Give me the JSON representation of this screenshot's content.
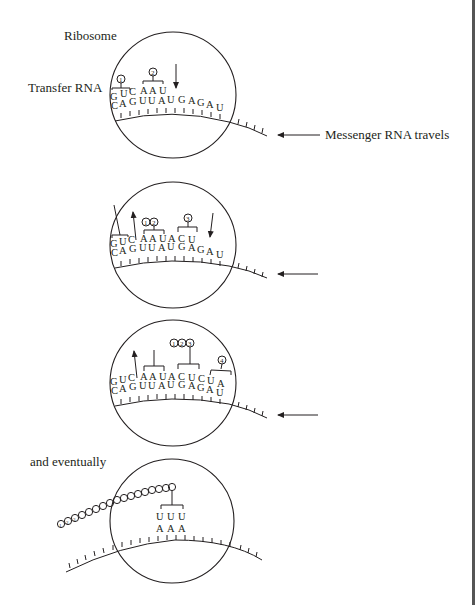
{
  "labels": {
    "ribosome": "Ribosome",
    "transfer_rna": "Transfer RNA",
    "messenger_rna": "Messenger RNA travels",
    "eventually": "and eventually"
  },
  "colors": {
    "ink": "#231f20",
    "background": "#ffffff",
    "edge": "#555555"
  },
  "panels": [
    {
      "id": 1,
      "trna_top": [
        "G",
        "U",
        "C",
        "A",
        "A",
        "U"
      ],
      "mrna_bottom": [
        "C",
        "A",
        "G",
        "U",
        "U",
        "A",
        "U",
        "G",
        "A",
        "G",
        "A",
        "U"
      ],
      "markers": [
        "1",
        "2"
      ],
      "arrows": [
        "down"
      ]
    },
    {
      "id": 2,
      "trna_top": [
        "G",
        "U",
        "C",
        "A",
        "A",
        "U",
        "A",
        "C",
        "U"
      ],
      "mrna_bottom": [
        "C",
        "A",
        "G",
        "U",
        "U",
        "A",
        "U",
        "G",
        "A",
        "G",
        "A",
        "U"
      ],
      "markers": [
        "1",
        "2",
        "3"
      ],
      "arrows": [
        "up-leaving",
        "down"
      ]
    },
    {
      "id": 3,
      "trna_top": [
        "G",
        "U",
        "C",
        "A",
        "A",
        "U",
        "A",
        "C",
        "U",
        "C",
        "U",
        "A"
      ],
      "mrna_bottom": [
        "C",
        "A",
        "G",
        "U",
        "U",
        "A",
        "U",
        "G",
        "A",
        "G",
        "A",
        "U"
      ],
      "markers": [
        "1",
        "2",
        "3",
        "4"
      ],
      "arrows": [
        "up-leaving"
      ]
    },
    {
      "id": 4,
      "trna_top": [
        "U",
        "U",
        "U"
      ],
      "mrna_bottom": [
        "A",
        "A",
        "A"
      ],
      "protein_chain_beads": 17,
      "protein_chain_labels": [
        "1",
        "2",
        "3"
      ]
    }
  ]
}
